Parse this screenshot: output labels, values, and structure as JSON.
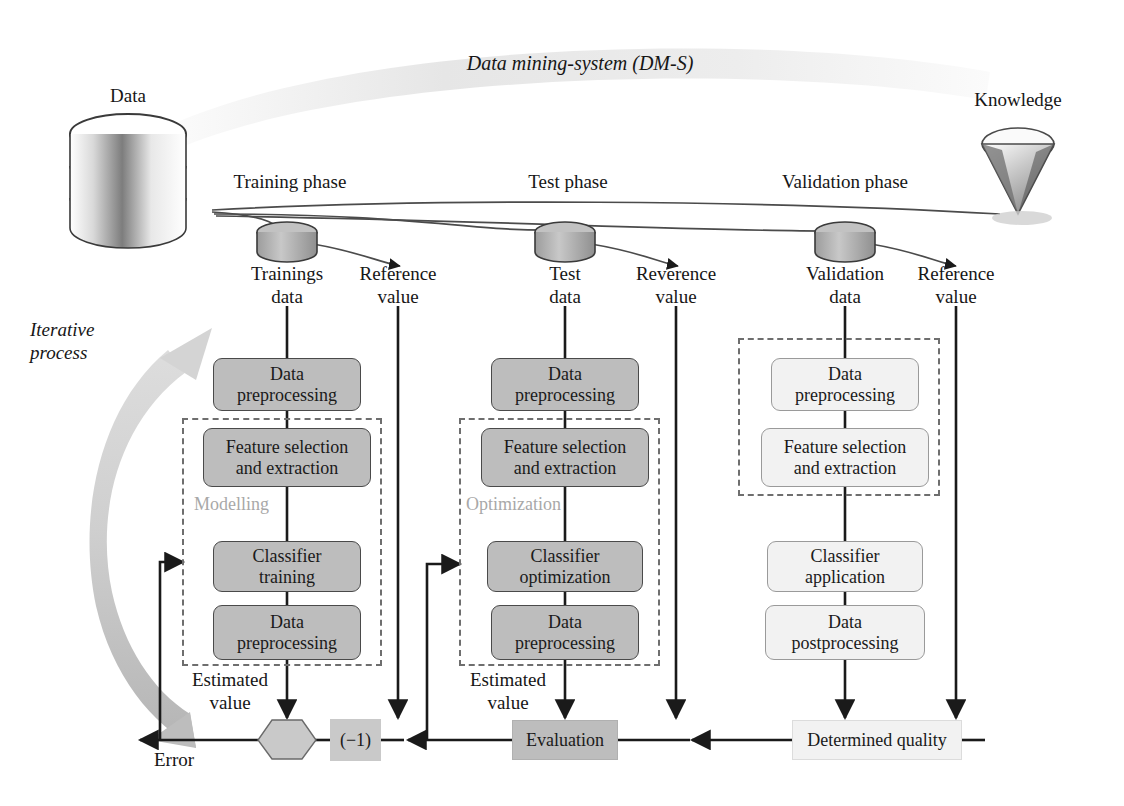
{
  "figure": {
    "banner_title": "Data mining-system (DM-S)",
    "source_label": "Data",
    "target_label": "Knowledge",
    "iterative_label": "Iterative\nprocess",
    "error_label": "Error"
  },
  "phases": [
    {
      "name": "training",
      "phase_label": "Training phase",
      "data_label": "Trainings\ndata",
      "reference_label": "Reference\nvalue",
      "estimated_label": "Estimated\nvalue",
      "group_label": "Modelling",
      "boxes": [
        {
          "label": "Data\npreprocessing",
          "style": "gray"
        },
        {
          "label": "Feature selection\nand extraction",
          "style": "gray"
        },
        {
          "label": "Classifier\ntraining",
          "style": "gray"
        },
        {
          "label": "Data\npreprocessing",
          "style": "gray"
        }
      ]
    },
    {
      "name": "test",
      "phase_label": "Test phase",
      "data_label": "Test\ndata",
      "reference_label": "Reverence\nvalue",
      "estimated_label": "Estimated\nvalue",
      "group_label": "Optimization",
      "boxes": [
        {
          "label": "Data\npreprocessing",
          "style": "gray"
        },
        {
          "label": "Feature selection\nand extraction",
          "style": "gray"
        },
        {
          "label": "Classifier\noptimization",
          "style": "gray"
        },
        {
          "label": "Data\npreprocessing",
          "style": "gray"
        }
      ]
    },
    {
      "name": "validation",
      "phase_label": "Validation phase",
      "data_label": "Validation\ndata",
      "reference_label": "Reference\nvalue",
      "estimated_label": "",
      "group_label": "",
      "boxes": [
        {
          "label": "Data\npreprocessing",
          "style": "light"
        },
        {
          "label": "Feature selection\nand extraction",
          "style": "light"
        },
        {
          "label": "Classifier\napplication",
          "style": "light"
        },
        {
          "label": "Data\npostprocessing",
          "style": "light"
        }
      ]
    }
  ],
  "bottom": {
    "sum_node": "+",
    "invert_node": "(−1)",
    "evaluation": "Evaluation",
    "determined_quality": "Determined quality"
  },
  "icons": {
    "database": "database-stack-icon",
    "knowledge": "diamond-gem-icon",
    "cylinder": "data-cylinder-icon",
    "sum": "sum-hexagon-icon"
  },
  "colors": {
    "box_gray": "#bdbdbd",
    "box_light": "#f2f2f2",
    "group_dash": "#6e6e6e",
    "banner": "#ededed",
    "iterative_arrow": "#c4c4c4",
    "stroke": "#1a1a1a"
  }
}
